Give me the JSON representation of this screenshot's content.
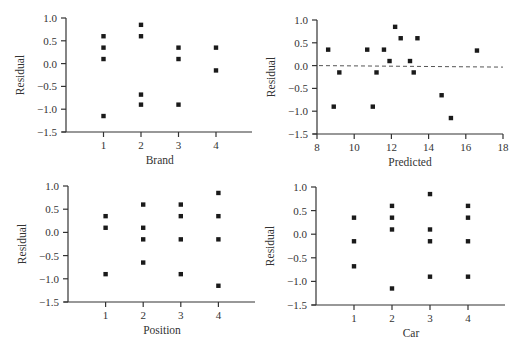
{
  "chart_data": [
    {
      "type": "scatter",
      "title": "",
      "xlabel": "Brand",
      "ylabel": "Residual",
      "ylim": [
        -1.5,
        1.0
      ],
      "xlim": [
        0,
        4.9
      ],
      "x_ticks": [
        "1",
        "2",
        "3",
        "4"
      ],
      "y_ticks": [
        "1.0",
        "0.5",
        "0.0",
        "−0.5",
        "−1.0",
        "−1.5"
      ],
      "grid": false,
      "legend": "none",
      "reference_line": null,
      "points": [
        {
          "x": 1,
          "y": 0.6
        },
        {
          "x": 1,
          "y": 0.35
        },
        {
          "x": 1,
          "y": 0.1
        },
        {
          "x": 1,
          "y": -1.15
        },
        {
          "x": 2,
          "y": 0.85
        },
        {
          "x": 2,
          "y": 0.6
        },
        {
          "x": 2,
          "y": -0.68
        },
        {
          "x": 2,
          "y": -0.9
        },
        {
          "x": 3,
          "y": 0.35
        },
        {
          "x": 3,
          "y": 0.1
        },
        {
          "x": 3,
          "y": -0.9
        },
        {
          "x": 4,
          "y": 0.35
        },
        {
          "x": 4,
          "y": -0.15
        }
      ]
    },
    {
      "type": "scatter",
      "title": "",
      "xlabel": "Predicted",
      "ylabel": "Residual",
      "ylim": [
        -1.5,
        1.0
      ],
      "xlim": [
        8,
        18
      ],
      "x_ticks": [
        "8",
        "10",
        "12",
        "14",
        "16",
        "18"
      ],
      "y_ticks": [
        "1.0",
        "0.5",
        "0.0",
        "−0.5",
        "−1.0",
        "−1.5"
      ],
      "grid": false,
      "legend": "none",
      "reference_line": {
        "y": 0.0,
        "style": "dashed"
      },
      "points": [
        {
          "x": 8.6,
          "y": 0.35
        },
        {
          "x": 8.9,
          "y": -0.9
        },
        {
          "x": 9.2,
          "y": -0.15
        },
        {
          "x": 10.7,
          "y": 0.35
        },
        {
          "x": 11.0,
          "y": -0.9
        },
        {
          "x": 11.2,
          "y": -0.15
        },
        {
          "x": 11.6,
          "y": 0.35
        },
        {
          "x": 11.9,
          "y": 0.1
        },
        {
          "x": 12.2,
          "y": 0.85
        },
        {
          "x": 12.5,
          "y": 0.6
        },
        {
          "x": 13.0,
          "y": 0.1
        },
        {
          "x": 13.2,
          "y": -0.15
        },
        {
          "x": 13.4,
          "y": 0.6
        },
        {
          "x": 14.7,
          "y": -0.65
        },
        {
          "x": 15.2,
          "y": -1.15
        },
        {
          "x": 16.6,
          "y": 0.33
        }
      ]
    },
    {
      "type": "scatter",
      "title": "",
      "xlabel": "Position",
      "ylabel": "Residual",
      "ylim": [
        -1.5,
        1.0
      ],
      "xlim": [
        0,
        4.9
      ],
      "x_ticks": [
        "1",
        "2",
        "3",
        "4"
      ],
      "y_ticks": [
        "1.0",
        "0.5",
        "0.0",
        "−0.5",
        "−1.0",
        "−1.5"
      ],
      "grid": false,
      "legend": "none",
      "reference_line": null,
      "points": [
        {
          "x": 1,
          "y": 0.35
        },
        {
          "x": 1,
          "y": 0.1
        },
        {
          "x": 1,
          "y": -0.9
        },
        {
          "x": 2,
          "y": 0.6
        },
        {
          "x": 2,
          "y": 0.1
        },
        {
          "x": 2,
          "y": -0.15
        },
        {
          "x": 2,
          "y": -0.65
        },
        {
          "x": 3,
          "y": 0.6
        },
        {
          "x": 3,
          "y": 0.35
        },
        {
          "x": 3,
          "y": -0.15
        },
        {
          "x": 3,
          "y": -0.9
        },
        {
          "x": 4,
          "y": 0.85
        },
        {
          "x": 4,
          "y": 0.35
        },
        {
          "x": 4,
          "y": -0.15
        },
        {
          "x": 4,
          "y": -1.15
        }
      ]
    },
    {
      "type": "scatter",
      "title": "",
      "xlabel": "Car",
      "ylabel": "Residual",
      "ylim": [
        -1.5,
        1.0
      ],
      "xlim": [
        0,
        4.9
      ],
      "x_ticks": [
        "1",
        "2",
        "3",
        "4"
      ],
      "y_ticks": [
        "1.0",
        "0.5",
        "0.0",
        "−0.5",
        "−1.0",
        "−1.5"
      ],
      "grid": false,
      "legend": "none",
      "reference_line": null,
      "points": [
        {
          "x": 1,
          "y": 0.35
        },
        {
          "x": 1,
          "y": -0.15
        },
        {
          "x": 1,
          "y": -0.68
        },
        {
          "x": 2,
          "y": 0.6
        },
        {
          "x": 2,
          "y": 0.35
        },
        {
          "x": 2,
          "y": 0.1
        },
        {
          "x": 2,
          "y": -1.15
        },
        {
          "x": 3,
          "y": 0.85
        },
        {
          "x": 3,
          "y": 0.1
        },
        {
          "x": 3,
          "y": -0.15
        },
        {
          "x": 3,
          "y": -0.9
        },
        {
          "x": 4,
          "y": 0.6
        },
        {
          "x": 4,
          "y": 0.35
        },
        {
          "x": 4,
          "y": -0.15
        },
        {
          "x": 4,
          "y": -0.9
        }
      ]
    }
  ],
  "colors": {
    "marker": "#1a1a1a",
    "axis": "#333333",
    "text": "#333333",
    "reference_line": "#555555"
  }
}
